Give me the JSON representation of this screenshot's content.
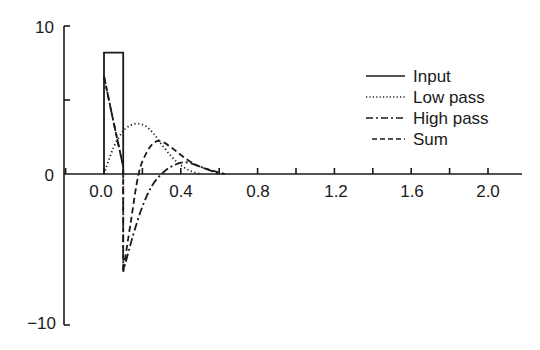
{
  "chart_data": {
    "type": "line",
    "title": "",
    "xlabel": "",
    "ylabel": "",
    "xlim": [
      -0.2,
      2.2
    ],
    "ylim": [
      -10,
      10
    ],
    "grid": false,
    "legend_position": "upper right",
    "x_ticks": [
      -0.2,
      0.0,
      0.2,
      0.4,
      0.6,
      0.8,
      1.0,
      1.2,
      1.4,
      1.6,
      1.8,
      2.0
    ],
    "x_tick_labels": [
      "0.0",
      "0.4",
      "0.8",
      "1.2",
      "1.6",
      "2.0"
    ],
    "y_ticks": [
      -10,
      0,
      5,
      10
    ],
    "y_tick_labels": [
      "10",
      "0",
      "−10"
    ],
    "series": [
      {
        "name": "Input",
        "style": "solid",
        "x": [
          0.0,
          0.0,
          0.1,
          0.1
        ],
        "y": [
          0.0,
          8.2,
          8.2,
          0.0
        ]
      },
      {
        "name": "Low pass",
        "style": "dotted",
        "x": [
          0.0,
          0.05,
          0.1,
          0.14,
          0.18,
          0.22,
          0.26,
          0.3,
          0.35,
          0.4,
          0.45,
          0.5
        ],
        "y": [
          0.0,
          1.8,
          2.9,
          3.3,
          3.4,
          3.2,
          2.7,
          2.0,
          1.2,
          0.6,
          0.2,
          0.0
        ]
      },
      {
        "name": "High pass",
        "style": "dash-dot",
        "x": [
          0.0,
          0.05,
          0.1,
          0.1,
          0.15,
          0.2,
          0.25,
          0.3,
          0.35,
          0.42,
          0.5,
          0.6
        ],
        "y": [
          6.6,
          3.5,
          0.5,
          -6.6,
          -4.2,
          -2.2,
          -0.8,
          0.0,
          0.5,
          0.8,
          0.5,
          0.0
        ]
      },
      {
        "name": "Sum",
        "style": "dashed",
        "x": [
          0.0,
          0.05,
          0.1,
          0.1,
          0.14,
          0.18,
          0.22,
          0.26,
          0.3,
          0.36,
          0.42,
          0.5,
          0.63
        ],
        "y": [
          6.6,
          3.5,
          0.5,
          -6.6,
          -3.2,
          0.0,
          1.4,
          2.1,
          2.2,
          1.7,
          1.1,
          0.5,
          0.0
        ]
      }
    ]
  },
  "axes": {
    "y_labels": [
      {
        "text": "10",
        "value": 10
      },
      {
        "text": "0",
        "value": 0
      },
      {
        "text": "−10",
        "value": -10
      }
    ],
    "x_labels": [
      {
        "text": "0.0",
        "value": 0.0
      },
      {
        "text": "0.4",
        "value": 0.4
      },
      {
        "text": "0.8",
        "value": 0.8
      },
      {
        "text": "1.2",
        "value": 1.2
      },
      {
        "text": "1.6",
        "value": 1.6
      },
      {
        "text": "2.0",
        "value": 2.0
      }
    ]
  },
  "legend": {
    "items": [
      {
        "label": "Input",
        "style": "solid"
      },
      {
        "label": "Low pass",
        "style": "dotted"
      },
      {
        "label": "High pass",
        "style": "dash-dot"
      },
      {
        "label": "Sum",
        "style": "dashed"
      }
    ]
  },
  "colors": {
    "ink": "#1a1a1a",
    "background": "#ffffff"
  }
}
